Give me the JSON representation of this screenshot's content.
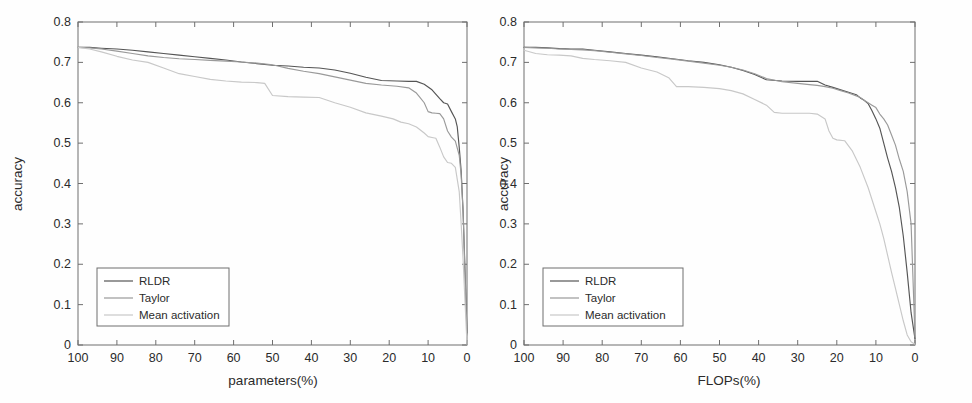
{
  "figure": {
    "background": "#fefefe",
    "panel_count": 2
  },
  "chart_data": [
    {
      "panel": "left",
      "type": "line",
      "title": "",
      "xlabel": "parameters(%)",
      "ylabel": "accuracy",
      "xlim": [
        100,
        0
      ],
      "ylim": [
        0,
        0.8
      ],
      "x_ticks": [
        "100",
        "90",
        "80",
        "70",
        "60",
        "50",
        "40",
        "30",
        "20",
        "10",
        "0"
      ],
      "x_tick_values": [
        100,
        90,
        80,
        70,
        60,
        50,
        40,
        30,
        20,
        10,
        0
      ],
      "y_ticks": [
        "0",
        "0.1",
        "0.2",
        "0.3",
        "0.4",
        "0.5",
        "0.6",
        "0.7",
        "0.8"
      ],
      "y_tick_values": [
        0,
        0.1,
        0.2,
        0.3,
        0.4,
        0.5,
        0.6,
        0.7,
        0.8
      ],
      "x_axis_reversed": true,
      "grid": false,
      "legend_position": "lower-left",
      "series": [
        {
          "name": "RLDR",
          "color": "#555555",
          "x": [
            100,
            97,
            94,
            90,
            86,
            82,
            78,
            74,
            70,
            66,
            62,
            58,
            54,
            50,
            46,
            42,
            38,
            34,
            30,
            26,
            22,
            18,
            15,
            13,
            11,
            9,
            7,
            6,
            5,
            4,
            3,
            2.5,
            2,
            1.5,
            1,
            0.5,
            0
          ],
          "y": [
            0.737,
            0.737,
            0.735,
            0.733,
            0.73,
            0.726,
            0.722,
            0.718,
            0.714,
            0.71,
            0.706,
            0.701,
            0.697,
            0.693,
            0.691,
            0.688,
            0.686,
            0.681,
            0.673,
            0.663,
            0.655,
            0.654,
            0.653,
            0.653,
            0.646,
            0.632,
            0.61,
            0.6,
            0.597,
            0.578,
            0.56,
            0.54,
            0.49,
            0.43,
            0.33,
            0.18,
            0.03
          ]
        },
        {
          "name": "Taylor",
          "color": "#9a9a9a",
          "x": [
            100,
            97,
            94,
            90,
            86,
            82,
            78,
            74,
            70,
            66,
            62,
            58,
            54,
            50,
            46,
            42,
            38,
            34,
            30,
            26,
            22,
            18,
            15,
            13,
            12,
            11,
            10,
            9,
            8,
            7,
            6,
            5,
            4,
            3,
            2,
            1.5,
            1,
            0.5,
            0
          ],
          "y": [
            0.737,
            0.736,
            0.733,
            0.728,
            0.722,
            0.716,
            0.712,
            0.709,
            0.707,
            0.705,
            0.703,
            0.701,
            0.698,
            0.694,
            0.685,
            0.678,
            0.672,
            0.664,
            0.656,
            0.648,
            0.644,
            0.641,
            0.637,
            0.624,
            0.612,
            0.6,
            0.578,
            0.575,
            0.574,
            0.573,
            0.56,
            0.53,
            0.515,
            0.505,
            0.47,
            0.42,
            0.33,
            0.17,
            0.025
          ]
        },
        {
          "name": "Mean activation",
          "color": "#c8c8c8",
          "x": [
            100,
            97,
            94,
            90,
            86,
            82,
            78,
            74,
            70,
            66,
            62,
            58,
            54,
            52,
            50,
            46,
            42,
            38,
            34,
            30,
            26,
            22,
            19,
            17,
            15,
            13,
            11,
            10,
            9,
            8,
            7,
            6,
            5,
            4,
            3,
            2,
            1.5,
            1,
            0.5,
            0
          ],
          "y": [
            0.737,
            0.733,
            0.726,
            0.715,
            0.706,
            0.7,
            0.686,
            0.672,
            0.665,
            0.658,
            0.654,
            0.651,
            0.65,
            0.648,
            0.618,
            0.615,
            0.614,
            0.613,
            0.6,
            0.589,
            0.575,
            0.567,
            0.56,
            0.552,
            0.548,
            0.54,
            0.525,
            0.516,
            0.514,
            0.512,
            0.49,
            0.466,
            0.452,
            0.45,
            0.44,
            0.38,
            0.3,
            0.21,
            0.105,
            0.002
          ]
        }
      ]
    },
    {
      "panel": "right",
      "type": "line",
      "title": "",
      "xlabel": "FLOPs(%)",
      "ylabel": "accuracy",
      "xlim": [
        100,
        0
      ],
      "ylim": [
        0,
        0.8
      ],
      "x_ticks": [
        "100",
        "90",
        "80",
        "70",
        "60",
        "50",
        "40",
        "30",
        "20",
        "10",
        "0"
      ],
      "x_tick_values": [
        100,
        90,
        80,
        70,
        60,
        50,
        40,
        30,
        20,
        10,
        0
      ],
      "y_ticks": [
        "0",
        "0.1",
        "0.2",
        "0.3",
        "0.4",
        "0.5",
        "0.6",
        "0.7",
        "0.8"
      ],
      "y_tick_values": [
        0,
        0.1,
        0.2,
        0.3,
        0.4,
        0.5,
        0.6,
        0.7,
        0.8
      ],
      "x_axis_reversed": true,
      "grid": false,
      "legend_position": "lower-left",
      "series": [
        {
          "name": "RLDR",
          "color": "#555555",
          "x": [
            100,
            97,
            94,
            91,
            88,
            85,
            82,
            78,
            74,
            70,
            66,
            62,
            58,
            54,
            50,
            47,
            44,
            41,
            38,
            34,
            30,
            27,
            25,
            23,
            21,
            19,
            17,
            15,
            14,
            13,
            12,
            11,
            10,
            9,
            8,
            7,
            6,
            5,
            4,
            3,
            2,
            1,
            0
          ],
          "y": [
            0.737,
            0.737,
            0.736,
            0.734,
            0.733,
            0.733,
            0.73,
            0.726,
            0.722,
            0.718,
            0.714,
            0.709,
            0.704,
            0.7,
            0.694,
            0.688,
            0.68,
            0.67,
            0.657,
            0.654,
            0.653,
            0.653,
            0.653,
            0.644,
            0.638,
            0.632,
            0.626,
            0.62,
            0.612,
            0.606,
            0.598,
            0.58,
            0.56,
            0.537,
            0.5,
            0.463,
            0.43,
            0.39,
            0.34,
            0.27,
            0.18,
            0.08,
            0.015
          ]
        },
        {
          "name": "Taylor",
          "color": "#9a9a9a",
          "x": [
            100,
            97,
            94,
            91,
            88,
            85,
            82,
            78,
            74,
            70,
            66,
            62,
            58,
            54,
            50,
            47,
            44,
            41,
            38,
            34,
            30,
            27,
            25,
            23,
            21,
            19,
            17,
            15,
            14,
            13,
            12,
            11,
            10,
            9,
            8,
            7,
            6,
            5,
            4,
            3,
            2,
            1,
            0
          ],
          "y": [
            0.737,
            0.736,
            0.735,
            0.733,
            0.732,
            0.731,
            0.729,
            0.725,
            0.721,
            0.717,
            0.712,
            0.708,
            0.703,
            0.698,
            0.693,
            0.688,
            0.681,
            0.672,
            0.66,
            0.652,
            0.648,
            0.645,
            0.643,
            0.64,
            0.636,
            0.63,
            0.624,
            0.617,
            0.613,
            0.606,
            0.6,
            0.594,
            0.588,
            0.572,
            0.56,
            0.545,
            0.52,
            0.495,
            0.46,
            0.43,
            0.38,
            0.3,
            0.02
          ]
        },
        {
          "name": "Mean activation",
          "color": "#c8c8c8",
          "x": [
            100,
            97,
            94,
            91,
            88,
            85,
            82,
            78,
            74,
            70,
            66,
            63,
            61,
            58,
            54,
            50,
            47,
            44,
            41,
            38,
            36,
            34,
            30,
            27,
            25,
            23,
            22,
            21,
            20,
            18,
            16,
            14,
            12,
            10,
            9,
            8,
            7,
            6,
            5,
            4,
            3,
            2,
            1,
            0
          ],
          "y": [
            0.73,
            0.722,
            0.719,
            0.718,
            0.716,
            0.71,
            0.707,
            0.704,
            0.7,
            0.686,
            0.676,
            0.662,
            0.64,
            0.64,
            0.638,
            0.635,
            0.63,
            0.622,
            0.608,
            0.594,
            0.576,
            0.574,
            0.574,
            0.574,
            0.572,
            0.56,
            0.53,
            0.512,
            0.508,
            0.506,
            0.48,
            0.44,
            0.39,
            0.33,
            0.3,
            0.264,
            0.222,
            0.18,
            0.14,
            0.1,
            0.06,
            0.025,
            0.008,
            0.002
          ]
        }
      ]
    }
  ],
  "legend": {
    "entries": [
      {
        "label": "RLDR",
        "color": "#555555"
      },
      {
        "label": "Taylor",
        "color": "#9a9a9a"
      },
      {
        "label": "Mean activation",
        "color": "#c8c8c8"
      }
    ]
  }
}
